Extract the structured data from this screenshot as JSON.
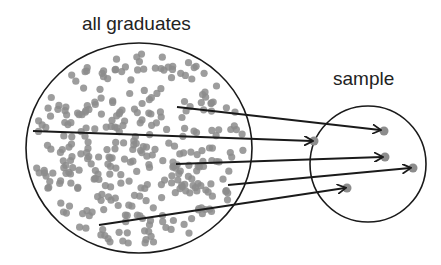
{
  "labels": {
    "population": "all graduates",
    "sample": "sample"
  },
  "colors": {
    "outline": "#1a1a1a",
    "dot": "#8c8c8c",
    "background": "#ffffff"
  },
  "diagram": {
    "population_circle": {
      "cx": 139,
      "cy": 148,
      "rx": 113,
      "ry": 105
    },
    "sample_circle": {
      "cx": 368,
      "cy": 164,
      "r": 58
    },
    "arrows": [
      {
        "from": [
          177,
          107
        ],
        "to": [
          380,
          130
        ]
      },
      {
        "from": [
          33,
          131
        ],
        "to": [
          312,
          141
        ]
      },
      {
        "from": [
          176,
          164
        ],
        "to": [
          382,
          157
        ]
      },
      {
        "from": [
          228,
          185
        ],
        "to": [
          410,
          168
        ]
      },
      {
        "from": [
          99,
          225
        ],
        "to": [
          345,
          188
        ]
      }
    ],
    "sample_points": [
      [
        384,
        131
      ],
      [
        314,
        141
      ],
      [
        385,
        157
      ],
      [
        413,
        168
      ],
      [
        347,
        188
      ]
    ]
  }
}
